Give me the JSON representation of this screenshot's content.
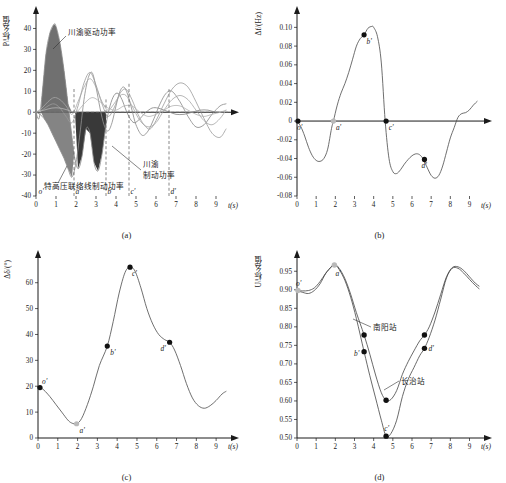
{
  "figure": {
    "panels": [
      {
        "caption": "(a)",
        "ylabel": "P/标幺值",
        "xlabel": "t(s)",
        "yticks": [
          "-40",
          "-30",
          "-20",
          "-10",
          "0",
          "10",
          "20",
          "30",
          "40"
        ],
        "xticks": [
          "0",
          "1",
          "2",
          "3",
          "4",
          "5",
          "6",
          "7",
          "8",
          "9"
        ],
        "markers": [
          "o'",
          "a'",
          "b'",
          "c'",
          "d'"
        ],
        "annotations": [
          {
            "text": "川渝驱动功率"
          },
          {
            "text": "川渝制动功率"
          },
          {
            "text": "特高压联络线制动功率"
          }
        ]
      },
      {
        "caption": "(b)",
        "ylabel": "Δf/(Hz)",
        "xlabel": "t(s)",
        "yticks": [
          "-0.08",
          "-0.06",
          "-0.04",
          "-0.02",
          "0",
          "0.02",
          "0.04",
          "0.06",
          "0.08",
          "0.10"
        ],
        "xticks": [
          "0",
          "1",
          "2",
          "3",
          "4",
          "5",
          "6",
          "7",
          "8",
          "9"
        ],
        "markers": [
          "o'",
          "a'",
          "b'",
          "c'",
          "d'"
        ]
      },
      {
        "caption": "(c)",
        "ylabel": "Δδ/(°)",
        "xlabel": "t(s)",
        "yticks": [
          "0",
          "10",
          "20",
          "30",
          "40",
          "50",
          "60"
        ],
        "xticks": [
          "0",
          "1",
          "2",
          "3",
          "4",
          "5",
          "6",
          "7",
          "8",
          "9"
        ],
        "markers": [
          "o'",
          "a'",
          "b'",
          "c'",
          "d'"
        ]
      },
      {
        "caption": "(d)",
        "ylabel": "U/标幺值",
        "xlabel": "t(s)",
        "yticks": [
          "0.50",
          "0.55",
          "0.60",
          "0.65",
          "0.70",
          "0.75",
          "0.80",
          "0.85",
          "0.90",
          "0.95"
        ],
        "xticks": [
          "0",
          "1",
          "2",
          "3",
          "4",
          "5",
          "6",
          "7",
          "8",
          "9"
        ],
        "markers": [
          "o'",
          "a'",
          "b'",
          "c'",
          "d'"
        ],
        "annotations": [
          {
            "text": "南阳站"
          },
          {
            "text": "长治站"
          }
        ]
      }
    ]
  },
  "chart_data": [
    {
      "type": "line",
      "panel": "(a)",
      "title": "",
      "xlabel": "t(s)",
      "ylabel": "P/标幺值",
      "xlim": [
        0,
        9.6
      ],
      "ylim": [
        -40,
        45
      ],
      "grid": false,
      "legend": null,
      "annotations": [
        {
          "label": "川渝驱动功率",
          "at_x": 1.0,
          "at_y": 38
        },
        {
          "label": "川渝制动功率",
          "at_x": 2.8,
          "at_y": -22
        },
        {
          "label": "特高压联络线制动功率",
          "at_x": 1.9,
          "at_y": -31
        }
      ],
      "event_markers": [
        {
          "name": "o'",
          "x": 0.08
        },
        {
          "name": "a'",
          "x": 1.9
        },
        {
          "name": "b'",
          "x": 3.5
        },
        {
          "name": "c'",
          "x": 4.65
        },
        {
          "name": "d'",
          "x": 6.65
        }
      ],
      "series": [
        {
          "name": "川渝驱动/制动功率",
          "x": [
            0,
            0.15,
            0.3,
            0.5,
            0.7,
            0.9,
            1.0,
            1.2,
            1.4,
            1.6,
            1.8,
            1.9,
            2.1,
            2.3,
            2.5,
            2.7,
            2.9,
            3.1,
            3.3,
            3.5,
            3.7,
            3.9,
            4.1,
            4.3,
            4.5,
            4.7,
            4.9,
            5.1,
            5.3,
            5.5,
            5.8,
            6.1,
            6.4,
            6.7,
            7.0,
            7.4,
            7.8,
            8.2,
            8.6,
            9.0,
            9.4
          ],
          "y": [
            0,
            -3,
            8,
            28,
            38,
            42,
            41,
            33,
            20,
            4,
            -12,
            -20,
            -27,
            -21,
            -8,
            -10,
            -24,
            -28,
            -20,
            -6,
            3,
            8,
            9,
            6,
            1,
            -3,
            -5,
            -4,
            -2,
            0,
            2,
            2,
            1,
            0,
            -1,
            -1,
            0,
            1,
            1,
            0,
            0
          ]
        },
        {
          "name": "特高压联络线功率",
          "x": [
            0,
            0.2,
            0.4,
            0.6,
            0.8,
            1.0,
            1.2,
            1.4,
            1.6,
            1.8,
            2.0,
            2.2,
            2.4,
            2.6,
            2.8,
            3.0,
            3.2,
            3.4,
            3.6,
            3.8,
            4.0,
            4.2,
            4.4,
            4.6,
            4.8,
            5.0,
            5.3,
            5.6,
            5.9,
            6.2,
            6.5,
            6.8,
            7.2,
            7.6,
            8.0,
            8.4,
            8.8,
            9.2,
            9.5
          ],
          "y": [
            0,
            -1,
            -3,
            -6,
            -10,
            -14,
            -18,
            -22,
            -27,
            -31,
            -24,
            -10,
            6,
            16,
            19,
            12,
            2,
            -6,
            -9,
            -5,
            3,
            10,
            12,
            8,
            1,
            -6,
            -11,
            -9,
            -3,
            4,
            9,
            10,
            5,
            -2,
            -7,
            -6,
            -1,
            3,
            4
          ]
        },
        {
          "name": "振荡功率曲线1",
          "x": [
            0,
            0.3,
            0.6,
            0.9,
            1.2,
            1.5,
            1.8,
            2.1,
            2.4,
            2.7,
            3.0,
            3.3,
            3.6,
            3.9,
            4.2,
            4.5,
            4.8,
            5.1,
            5.4,
            5.7,
            6.0,
            6.4,
            6.8,
            7.2,
            7.6,
            8.0,
            8.4,
            8.8,
            9.2,
            9.5
          ],
          "y": [
            0,
            1,
            3,
            4,
            2,
            -2,
            -5,
            3,
            14,
            19,
            13,
            4,
            -2,
            2,
            9,
            11,
            6,
            -1,
            -6,
            -8,
            -4,
            4,
            11,
            14,
            12,
            5,
            -3,
            -10,
            -12,
            -8
          ]
        },
        {
          "name": "振荡功率曲线2",
          "x": [
            0,
            0.3,
            0.6,
            0.9,
            1.2,
            1.5,
            1.8,
            2.1,
            2.4,
            2.7,
            3.0,
            3.3,
            3.6,
            3.9,
            4.2,
            4.5,
            4.8,
            5.2,
            5.6,
            6.0,
            6.4,
            6.8,
            7.2,
            7.6,
            8.0,
            8.4,
            8.8,
            9.2,
            9.5
          ],
          "y": [
            0,
            2,
            5,
            7,
            6,
            3,
            -1,
            5,
            12,
            16,
            12,
            5,
            1,
            4,
            8,
            8,
            3,
            -4,
            -7,
            -5,
            1,
            6,
            8,
            6,
            1,
            -4,
            -6,
            -3,
            1
          ]
        },
        {
          "name": "振荡功率曲线3",
          "x": [
            0,
            0.4,
            0.8,
            1.2,
            1.6,
            2.0,
            2.4,
            2.8,
            3.2,
            3.6,
            4.0,
            4.4,
            4.8,
            5.2,
            5.6,
            6.0,
            6.4,
            6.8,
            7.2,
            7.6,
            8.0,
            8.4,
            8.8,
            9.2,
            9.5
          ],
          "y": [
            0,
            1,
            2,
            2,
            1,
            0,
            4,
            7,
            5,
            2,
            1,
            3,
            3,
            0,
            -2,
            -1,
            1,
            3,
            3,
            1,
            -1,
            -2,
            -1,
            0,
            1
          ]
        }
      ]
    },
    {
      "type": "line",
      "panel": "(b)",
      "title": "",
      "xlabel": "t(s)",
      "ylabel": "Δf/(Hz)",
      "xlim": [
        0,
        9.6
      ],
      "ylim": [
        -0.08,
        0.11
      ],
      "grid": false,
      "legend": null,
      "event_markers": [
        {
          "name": "o'",
          "x": 0.05,
          "y": 0.0
        },
        {
          "name": "a'",
          "x": 1.9,
          "y": 0.0
        },
        {
          "name": "b'",
          "x": 3.5,
          "y": 0.092
        },
        {
          "name": "c'",
          "x": 4.65,
          "y": 0.0
        },
        {
          "name": "d'",
          "x": 6.65,
          "y": -0.041
        }
      ],
      "series": [
        {
          "name": "Δf",
          "x": [
            0,
            0.2,
            0.4,
            0.6,
            0.8,
            1.0,
            1.2,
            1.4,
            1.6,
            1.8,
            1.9,
            2.1,
            2.3,
            2.5,
            2.7,
            2.9,
            3.1,
            3.3,
            3.5,
            3.7,
            3.9,
            4.0,
            4.2,
            4.4,
            4.6,
            4.8,
            5.0,
            5.2,
            5.4,
            5.6,
            5.8,
            6.0,
            6.2,
            6.4,
            6.6,
            6.8,
            7.0,
            7.2,
            7.4,
            7.6,
            7.8,
            8.0,
            8.2,
            8.4,
            8.6,
            8.8,
            9.0,
            9.2,
            9.4
          ],
          "y": [
            0.0,
            -0.006,
            -0.016,
            -0.028,
            -0.037,
            -0.042,
            -0.043,
            -0.04,
            -0.03,
            -0.008,
            0.0,
            0.017,
            0.03,
            0.04,
            0.052,
            0.066,
            0.08,
            0.088,
            0.092,
            0.099,
            0.101,
            0.1,
            0.09,
            0.062,
            0.0,
            -0.04,
            -0.054,
            -0.056,
            -0.052,
            -0.046,
            -0.041,
            -0.037,
            -0.035,
            -0.036,
            -0.041,
            -0.05,
            -0.058,
            -0.061,
            -0.058,
            -0.048,
            -0.033,
            -0.018,
            -0.007,
            0.004,
            0.008,
            0.009,
            0.012,
            0.017,
            0.021
          ]
        }
      ]
    },
    {
      "type": "line",
      "panel": "(c)",
      "title": "",
      "xlabel": "t(s)",
      "ylabel": "Δδ/(°)",
      "xlim": [
        0,
        9.6
      ],
      "ylim": [
        0,
        68
      ],
      "grid": false,
      "legend": null,
      "event_markers": [
        {
          "name": "o'",
          "x": 0.1,
          "y": 19.5
        },
        {
          "name": "a'",
          "x": 1.95,
          "y": 5.5
        },
        {
          "name": "b'",
          "x": 3.5,
          "y": 35.5
        },
        {
          "name": "c'",
          "x": 4.65,
          "y": 66.0
        },
        {
          "name": "d'",
          "x": 6.65,
          "y": 37.0
        }
      ],
      "series": [
        {
          "name": "Δδ",
          "x": [
            0,
            0.1,
            0.3,
            0.6,
            0.9,
            1.2,
            1.5,
            1.7,
            1.95,
            2.2,
            2.5,
            2.8,
            3.1,
            3.5,
            3.8,
            4.1,
            4.4,
            4.65,
            4.9,
            5.2,
            5.5,
            5.8,
            6.1,
            6.4,
            6.65,
            6.9,
            7.2,
            7.5,
            7.8,
            8.1,
            8.4,
            8.7,
            9.0,
            9.3,
            9.5
          ],
          "y": [
            19.5,
            19.5,
            18.5,
            16.0,
            13.0,
            10.0,
            7.0,
            5.8,
            5.5,
            7.5,
            13.0,
            20.0,
            28.0,
            35.5,
            45.0,
            56.0,
            64.0,
            66.0,
            64.5,
            58.0,
            50.0,
            44.0,
            40.0,
            38.0,
            37.0,
            34.0,
            28.0,
            21.0,
            15.5,
            12.5,
            11.5,
            12.5,
            14.5,
            17.0,
            18.0
          ]
        }
      ]
    },
    {
      "type": "line",
      "panel": "(d)",
      "title": "",
      "xlabel": "t(s)",
      "ylabel": "U/标幺值",
      "xlim": [
        0,
        9.6
      ],
      "ylim": [
        0.5,
        0.975
      ],
      "grid": false,
      "legend": null,
      "annotations": [
        {
          "label": "南阳站",
          "at_x": 4.2,
          "at_y": 0.755
        },
        {
          "label": "长治站",
          "at_x": 6.0,
          "at_y": 0.655
        }
      ],
      "event_markers": [
        {
          "name": "o'",
          "x": 0.05,
          "y": 0.898
        },
        {
          "name": "a'",
          "x": 1.95,
          "y": 0.967
        },
        {
          "name": "b'",
          "x": 3.5,
          "y": 0.733
        },
        {
          "name": "c'",
          "x": 4.65,
          "y": 0.505
        },
        {
          "name": "d'",
          "x": 6.65,
          "y": 0.742
        }
      ],
      "series": [
        {
          "name": "南阳站",
          "x": [
            0,
            0.3,
            0.6,
            0.9,
            1.2,
            1.5,
            1.8,
            1.95,
            2.2,
            2.5,
            2.8,
            3.1,
            3.5,
            3.8,
            4.1,
            4.4,
            4.65,
            4.9,
            5.2,
            5.5,
            5.8,
            6.1,
            6.4,
            6.65,
            6.9,
            7.2,
            7.5,
            7.8,
            8.1,
            8.4,
            8.7,
            9.0,
            9.3,
            9.5
          ],
          "y": [
            0.898,
            0.897,
            0.898,
            0.905,
            0.922,
            0.945,
            0.963,
            0.97,
            0.958,
            0.93,
            0.888,
            0.838,
            0.778,
            0.726,
            0.67,
            0.622,
            0.602,
            0.604,
            0.628,
            0.672,
            0.706,
            0.735,
            0.762,
            0.778,
            0.8,
            0.84,
            0.888,
            0.935,
            0.96,
            0.962,
            0.952,
            0.935,
            0.918,
            0.91
          ]
        },
        {
          "name": "长治站",
          "x": [
            0,
            0.3,
            0.6,
            0.9,
            1.2,
            1.5,
            1.8,
            1.95,
            2.2,
            2.5,
            2.8,
            3.1,
            3.5,
            3.8,
            4.1,
            4.4,
            4.65,
            4.9,
            5.2,
            5.5,
            5.8,
            6.1,
            6.4,
            6.65,
            6.9,
            7.2,
            7.5,
            7.8,
            8.1,
            8.4,
            8.7,
            9.0,
            9.3,
            9.5
          ],
          "y": [
            0.898,
            0.893,
            0.89,
            0.898,
            0.916,
            0.944,
            0.962,
            0.968,
            0.955,
            0.925,
            0.88,
            0.822,
            0.733,
            0.668,
            0.608,
            0.548,
            0.505,
            0.512,
            0.548,
            0.612,
            0.658,
            0.69,
            0.722,
            0.742,
            0.772,
            0.818,
            0.875,
            0.932,
            0.958,
            0.958,
            0.945,
            0.928,
            0.912,
            0.903
          ]
        }
      ]
    }
  ]
}
